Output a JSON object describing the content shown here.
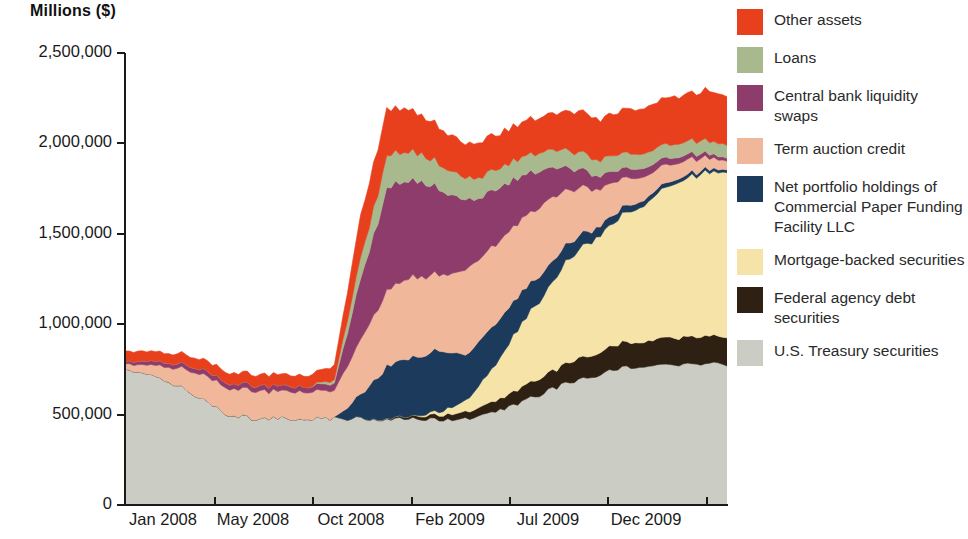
{
  "axis": {
    "y_title": "Millions ($)",
    "y_ticks": [
      "2,500,000",
      "2,000,000",
      "1,500,000",
      "1,000,000",
      "500,000",
      "0"
    ],
    "x_ticks": [
      "Jan 2008",
      "May 2008",
      "Oct 2008",
      "Feb 2009",
      "Jul 2009",
      "Dec 2009"
    ]
  },
  "legend": {
    "items": [
      {
        "label": "Other assets",
        "color": "#E8401C"
      },
      {
        "label": "Loans",
        "color": "#A9B98E"
      },
      {
        "label": "Central bank liquidity swaps",
        "color": "#8E3C6B"
      },
      {
        "label": "Term auction credit",
        "color": "#F0B79A"
      },
      {
        "label": "Net portfolio holdings of Commercial Paper Funding Facility LLC",
        "color": "#1B3A5C"
      },
      {
        "label": "Mortgage-backed securities",
        "color": "#F5E3A8"
      },
      {
        "label": "Federal agency debt securities",
        "color": "#2E2013"
      },
      {
        "label": "U.S. Treasury securities",
        "color": "#CBCCC4"
      }
    ]
  },
  "chart_data": {
    "type": "area",
    "stacked": true,
    "title": "",
    "xlabel": "",
    "ylabel": "Millions ($)",
    "ylim": [
      0,
      2500000
    ],
    "grid": false,
    "legend_position": "right",
    "x": [
      "Jan 2008",
      "Feb 2008",
      "Mar 2008",
      "Apr 2008",
      "May 2008",
      "Jun 2008",
      "Jul 2008",
      "Aug 2008",
      "Sep 2008",
      "Oct 2008",
      "Nov 2008",
      "Dec 2008",
      "Jan 2009",
      "Feb 2009",
      "Mar 2009",
      "Apr 2009",
      "May 2009",
      "Jun 2009",
      "Jul 2009",
      "Aug 2009",
      "Sep 2009",
      "Oct 2009",
      "Nov 2009",
      "Dec 2009"
    ],
    "series": [
      {
        "name": "U.S. Treasury securities",
        "color": "#CBCCC4",
        "values": [
          745000,
          715000,
          660000,
          585000,
          495000,
          480000,
          480000,
          480000,
          480000,
          480000,
          476000,
          476000,
          476000,
          475000,
          505000,
          560000,
          620000,
          680000,
          720000,
          755000,
          775000,
          780000,
          780000,
          780000
        ]
      },
      {
        "name": "Federal agency debt securities",
        "color": "#2E2013",
        "values": [
          0,
          0,
          0,
          0,
          0,
          0,
          0,
          0,
          0,
          0,
          5000,
          15000,
          25000,
          38000,
          55000,
          75000,
          95000,
          110000,
          125000,
          135000,
          142000,
          148000,
          152000,
          155000
        ]
      },
      {
        "name": "Mortgage-backed securities",
        "color": "#F5E3A8",
        "values": [
          0,
          0,
          0,
          0,
          0,
          0,
          0,
          0,
          0,
          0,
          0,
          0,
          20000,
          60000,
          180000,
          330000,
          450000,
          580000,
          640000,
          700000,
          775000,
          855000,
          900000,
          910000
        ]
      },
      {
        "name": "Net portfolio holdings of Commercial Paper Funding Facility LLC",
        "color": "#1B3A5C",
        "values": [
          0,
          0,
          0,
          0,
          0,
          0,
          0,
          0,
          0,
          130000,
          290000,
          330000,
          340000,
          255000,
          230000,
          180000,
          130000,
          90000,
          55000,
          40000,
          30000,
          22000,
          18000,
          15000
        ]
      },
      {
        "name": "Term auction credit",
        "color": "#F0B79A",
        "values": [
          30000,
          55000,
          95000,
          140000,
          150000,
          150000,
          150000,
          150000,
          150000,
          300000,
          415000,
          450000,
          415000,
          470000,
          450000,
          410000,
          370000,
          290000,
          220000,
          160000,
          120000,
          90000,
          70000,
          50000
        ]
      },
      {
        "name": "Central bank liquidity swaps",
        "color": "#8E3C6B",
        "values": [
          15000,
          22000,
          25000,
          28000,
          28000,
          30000,
          30000,
          30000,
          40000,
          330000,
          560000,
          545000,
          470000,
          380000,
          310000,
          250000,
          185000,
          120000,
          75000,
          55000,
          45000,
          35000,
          25000,
          15000
        ]
      },
      {
        "name": "Loans",
        "color": "#A9B98E",
        "values": [
          0,
          0,
          0,
          0,
          0,
          0,
          0,
          0,
          20000,
          120000,
          180000,
          155000,
          140000,
          120000,
          110000,
          105000,
          100000,
          95000,
          90000,
          85000,
          80000,
          75000,
          72000,
          70000
        ]
      },
      {
        "name": "Other assets",
        "color": "#E8401C",
        "values": [
          55000,
          55000,
          55000,
          55000,
          60000,
          60000,
          62000,
          62000,
          80000,
          230000,
          260000,
          230000,
          200000,
          195000,
          190000,
          195000,
          200000,
          215000,
          225000,
          240000,
          250000,
          260000,
          270000,
          280000
        ]
      }
    ]
  }
}
